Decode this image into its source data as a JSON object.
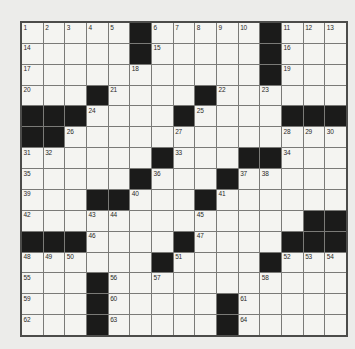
{
  "colors": {
    "page_bg": "#ececea",
    "cell_bg": "#f4f4f1",
    "black_cell": "#1b1b1a",
    "grid_line": "#7a7a77",
    "grid_border": "#4c4c4a",
    "number_color": "#2a2a28"
  },
  "grid": {
    "rows": 15,
    "cols": 15,
    "black_symbol": "#",
    "numbers_range": "1-64",
    "cells": [
      [
        "1",
        "2",
        "3",
        "4",
        "5",
        "#",
        "6",
        "7",
        "8",
        "9",
        "10",
        "#",
        "11",
        "12",
        "13"
      ],
      [
        "14",
        "",
        "",
        "",
        "",
        "#",
        "15",
        "",
        "",
        "",
        "",
        "#",
        "16",
        "",
        ""
      ],
      [
        "17",
        "",
        "",
        "",
        "",
        "18",
        "",
        "",
        "",
        "",
        "",
        "#",
        "19",
        "",
        ""
      ],
      [
        "20",
        "",
        "",
        "#",
        "21",
        "",
        "",
        "",
        "#",
        "22",
        "",
        "23",
        "",
        "",
        ""
      ],
      [
        "#",
        "#",
        "#",
        "24",
        "",
        "",
        "",
        "#",
        "25",
        "",
        "",
        "",
        "#",
        "#",
        "#"
      ],
      [
        "#",
        "#",
        "26",
        "",
        "",
        "",
        "",
        "27",
        "",
        "",
        "",
        "",
        "28",
        "29",
        "30"
      ],
      [
        "31",
        "32",
        "",
        "",
        "",
        "",
        "#",
        "33",
        "",
        "",
        "#",
        "#",
        "34",
        "",
        ""
      ],
      [
        "35",
        "",
        "",
        "",
        "",
        "#",
        "36",
        "",
        "",
        "#",
        "37",
        "38",
        "",
        "",
        ""
      ],
      [
        "39",
        "",
        "",
        "#",
        "#",
        "40",
        "",
        "",
        "#",
        "41",
        "",
        "",
        "",
        "",
        ""
      ],
      [
        "42",
        "",
        "",
        "43",
        "44",
        "",
        "",
        "",
        "45",
        "",
        "",
        "",
        "",
        "#",
        "#"
      ],
      [
        "#",
        "#",
        "#",
        "46",
        "",
        "",
        "",
        "#",
        "47",
        "",
        "",
        "",
        "#",
        "#",
        "#"
      ],
      [
        "48",
        "49",
        "50",
        "",
        "",
        "",
        "#",
        "51",
        "",
        "",
        "",
        "#",
        "52",
        "53",
        "54"
      ],
      [
        "55",
        "",
        "",
        "#",
        "56",
        "",
        "57",
        "",
        "",
        "",
        "",
        "58",
        "",
        "",
        ""
      ],
      [
        "59",
        "",
        "",
        "#",
        "60",
        "",
        "",
        "",
        "",
        "#",
        "61",
        "",
        "",
        "",
        ""
      ],
      [
        "62",
        "",
        "",
        "#",
        "63",
        "",
        "",
        "",
        "",
        "#",
        "64",
        "",
        "",
        "",
        ""
      ]
    ]
  }
}
